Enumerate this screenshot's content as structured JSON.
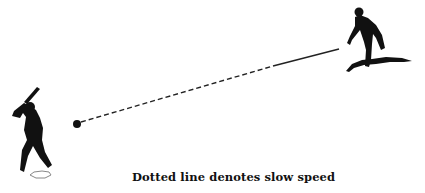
{
  "caption": "Dotted line denotes slow speed",
  "figures": {
    "batter": "batter-silhouette",
    "pitcher": "pitcher-silhouette",
    "ball": "baseball",
    "home_plate": "home-plate",
    "pitchers_mound": "pitchers-mound"
  },
  "trajectory": {
    "style_near_pitcher": "solid",
    "style_near_batter": "dashed",
    "meaning": "slow speed"
  },
  "colors": {
    "background": "#ffffff",
    "ink": "#111111"
  }
}
